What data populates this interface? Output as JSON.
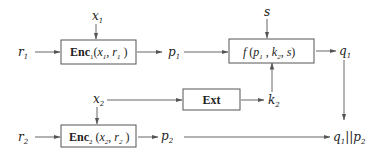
{
  "diagram": {
    "nodes": {
      "x1": {
        "label": "x",
        "sub": "1"
      },
      "r1": {
        "label": "r",
        "sub": "1"
      },
      "enc1": {
        "name": "Enc",
        "sub": "1",
        "args_a": "x",
        "args_a_sub": "1",
        "args_b": "r",
        "args_b_sub": "1"
      },
      "p1": {
        "label": "p",
        "sub": "1"
      },
      "s": {
        "label": "s"
      },
      "f": {
        "name": "f",
        "arg1": "p",
        "arg1_sub": "1",
        "arg2": "k",
        "arg2_sub": "2",
        "arg3": "s"
      },
      "q1": {
        "label": "q",
        "sub": "1"
      },
      "x2": {
        "label": "x",
        "sub": "2"
      },
      "ext": {
        "name": "Ext"
      },
      "k2": {
        "label": "k",
        "sub": "2"
      },
      "r2": {
        "label": "r",
        "sub": "2"
      },
      "enc2": {
        "name": "Enc",
        "sub": "2",
        "args_a": "x",
        "args_a_sub": "2",
        "args_b": "r",
        "args_b_sub": "2"
      },
      "p2": {
        "label": "p",
        "sub": "2"
      },
      "out": {
        "a": "q",
        "a_sub": "1",
        "sep": "||",
        "b": "p",
        "b_sub": "2"
      }
    },
    "edges": [
      {
        "from": "x1",
        "to": "enc1"
      },
      {
        "from": "r1",
        "to": "enc1"
      },
      {
        "from": "enc1",
        "to": "p1"
      },
      {
        "from": "p1",
        "to": "f"
      },
      {
        "from": "s",
        "to": "f"
      },
      {
        "from": "f",
        "to": "q1"
      },
      {
        "from": "q1",
        "to": "out"
      },
      {
        "from": "x2",
        "to": "ext"
      },
      {
        "from": "ext",
        "to": "k2"
      },
      {
        "from": "k2",
        "to": "f"
      },
      {
        "from": "x2",
        "to": "enc2"
      },
      {
        "from": "r2",
        "to": "enc2"
      },
      {
        "from": "enc2",
        "to": "p2"
      },
      {
        "from": "p2",
        "to": "out"
      }
    ]
  }
}
